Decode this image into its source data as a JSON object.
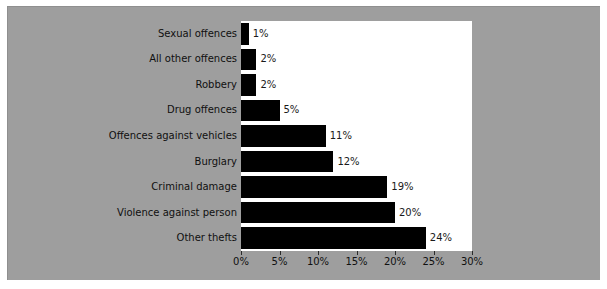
{
  "chart_data": {
    "type": "bar",
    "orientation": "horizontal",
    "title": "",
    "xlabel": "",
    "ylabel": "",
    "xlim": [
      0,
      30
    ],
    "grid": false,
    "legend": null,
    "xticks": [
      "0%",
      "5%",
      "10%",
      "15%",
      "20%",
      "25%",
      "30%"
    ],
    "xtick_values": [
      0,
      5,
      10,
      15,
      20,
      25,
      30
    ],
    "categories": [
      "Sexual offences",
      "All other offences",
      "Robbery",
      "Drug offences",
      "Offences against vehicles",
      "Burglary",
      "Criminal damage",
      "Violence against person",
      "Other thefts"
    ],
    "values": [
      1,
      2,
      2,
      5,
      11,
      12,
      19,
      20,
      24
    ],
    "value_labels": [
      "1%",
      "2%",
      "2%",
      "5%",
      "11%",
      "12%",
      "19%",
      "20%",
      "24%"
    ]
  },
  "colors": {
    "bar": "#000000",
    "plot_background": "#ffffff",
    "panel_background": "#9e9e9e",
    "page_background": "#ffffff",
    "text": "#101010"
  }
}
